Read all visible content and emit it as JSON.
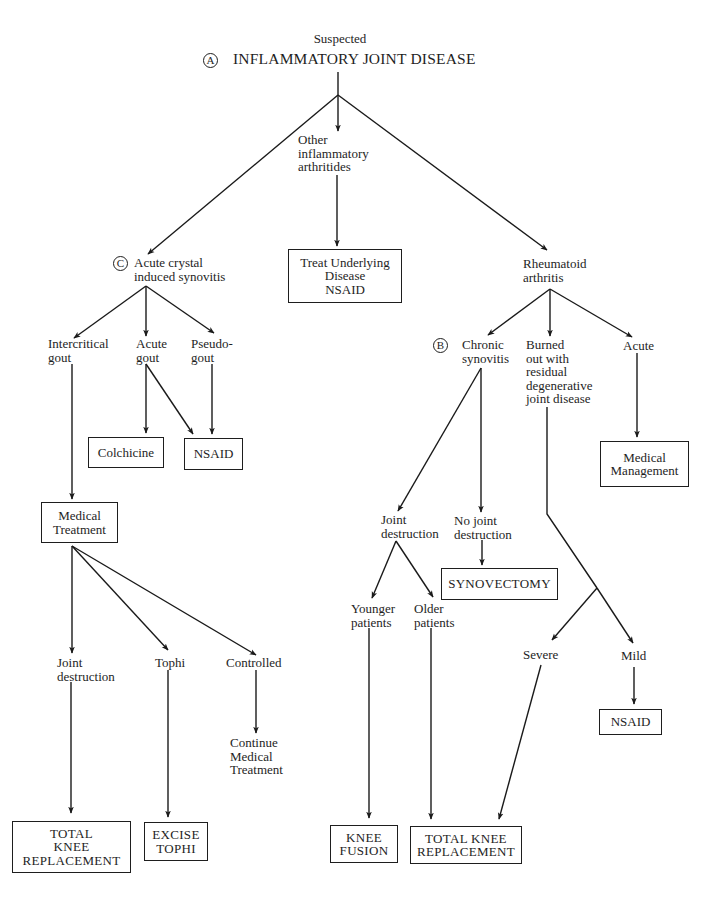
{
  "diagram": {
    "title_pre": "Suspected",
    "title_main": "INFLAMMATORY JOINT DISEASE",
    "markers": {
      "a": "A",
      "b": "B",
      "c": "C"
    },
    "nodes": {
      "other_arthritides": "Other\ninflammatory\narthritides",
      "acute_crystal": "Acute crystal\ninduced synovitis",
      "rheumatoid": "Rheumatoid\narthritis",
      "intercritical_gout": "Intercritical\ngout",
      "acute_gout": "Acute\ngout",
      "pseudogout": "Pseudo-\ngout",
      "chronic_synovitis": "Chronic\nsynovitis",
      "burned_out": "Burned\nout with\nresidual\ndegenerative\njoint disease",
      "ra_acute": "Acute",
      "joint_destruction_ra": "Joint\ndestruction",
      "no_joint_destruction": "No joint\ndestruction",
      "younger_patients": "Younger\npatients",
      "older_patients": "Older\npatients",
      "severe": "Severe",
      "mild": "Mild",
      "joint_destruction_gout": "Joint\ndestruction",
      "tophi": "Tophi",
      "controlled": "Controlled",
      "continue_medical": "Continue\nMedical\nTreatment"
    },
    "boxes": {
      "treat_underlying": "Treat Underlying\nDisease\nNSAID",
      "colchicine": "Colchicine",
      "nsaid_gout": "NSAID",
      "medical_treatment": "Medical\nTreatment",
      "medical_management": "Medical\nManagement",
      "synovectomy": "SYNOVECTOMY",
      "nsaid_mild": "NSAID",
      "tkr_gout": "TOTAL\nKNEE\nREPLACEMENT",
      "excise_tophi": "EXCISE\nTOPHI",
      "knee_fusion": "KNEE\nFUSION",
      "tkr_ra": "TOTAL KNEE\nREPLACEMENT"
    }
  }
}
